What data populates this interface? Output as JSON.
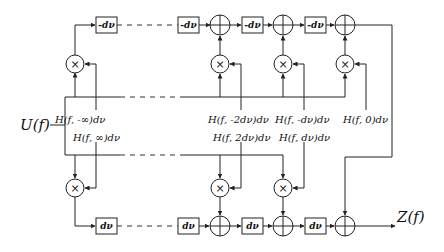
{
  "diagram": {
    "input_label": "U(f)",
    "output_label": "Z(f)",
    "top_branch": {
      "delay_label": "-dν",
      "gain_labels": [
        "H(f, -∞)dν",
        "H(f, -2dν)dν",
        "H(f, -dν)dν",
        "H(f, 0)dν"
      ]
    },
    "bottom_branch": {
      "delay_label": "dν",
      "gain_labels": [
        "H(f, ∞)dν",
        "H(f, 2dν)dν",
        "H(f, dν)dν"
      ]
    },
    "multiplier_symbol": "×",
    "adder_symbol": "+"
  }
}
